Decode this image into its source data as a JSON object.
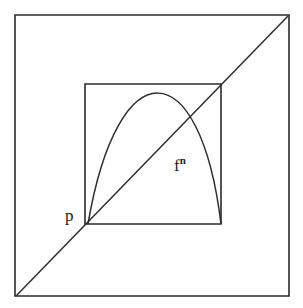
{
  "figure": {
    "background_color": "#fefefe",
    "stroke_color": "#2b2b2b",
    "labels": {
      "fixed_point": "p",
      "map_base": "f",
      "map_exponent": "n"
    },
    "geometry": {
      "outer_square": {
        "name": "outer-square",
        "x1": 15,
        "y1": 15,
        "x2": 289,
        "y2": 296,
        "points": "15,15 289,15 289,296 15,296"
      },
      "inner_square": {
        "name": "inner-square",
        "x1": 85,
        "y1": 84,
        "x2": 221,
        "y2": 224,
        "points": "85,84 221,84 221,224 85,224"
      },
      "diagonal": {
        "name": "identity-diagonal",
        "x1": 16,
        "y1": 296,
        "x2": 288,
        "y2": 16
      },
      "parabola": {
        "name": "parabola-curve",
        "start": [
          88,
          224
        ],
        "apex": [
          157,
          79
        ],
        "end": [
          221,
          224
        ],
        "control1": [
          118,
          48
        ],
        "control2": [
          200,
          51
        ]
      },
      "label_positions": {
        "p": [
          67,
          222
        ],
        "fn": [
          176,
          172
        ]
      }
    }
  }
}
